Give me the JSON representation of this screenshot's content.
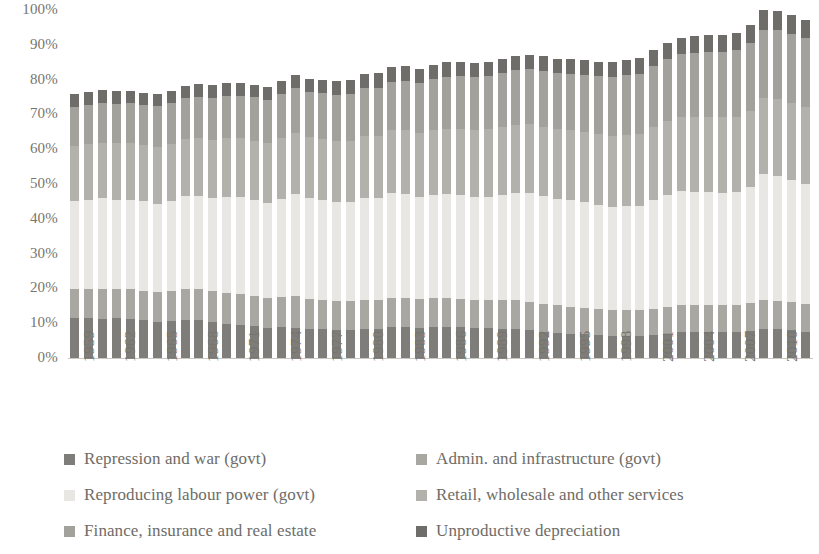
{
  "axes": {
    "y_ticks": [
      "100%",
      "90%",
      "80%",
      "70%",
      "60%",
      "50%",
      "40%",
      "30%",
      "20%",
      "10%",
      "0%"
    ],
    "y_min": 0,
    "y_max": 100,
    "x_tick_labels": [
      "1959",
      "1962",
      "1965",
      "1968",
      "1971",
      "1974",
      "1977",
      "1980",
      "1983",
      "1986",
      "1989",
      "1992",
      "1995",
      "1998",
      "2001",
      "2004",
      "2007",
      "2010"
    ]
  },
  "legend": {
    "items": [
      {
        "label": "Repression and war (govt)",
        "color": "#7f7d79"
      },
      {
        "label": "Admin. and infrastructure (govt)",
        "color": "#a9a7a2"
      },
      {
        "label": "Reproducing labour power (govt)",
        "color": "#e8e7e3"
      },
      {
        "label": "Retail, wholesale and other services",
        "color": "#b3b1ac"
      },
      {
        "label": "Finance, insurance and real estate",
        "color": "#a3a19c"
      },
      {
        "label": "Unproductive depreciation",
        "color": "#6f6d69"
      }
    ]
  },
  "chart_data": {
    "type": "bar",
    "stacked": true,
    "title": "",
    "xlabel": "",
    "ylabel": "",
    "ylim": [
      0,
      100
    ],
    "grid": false,
    "legend_position": "bottom",
    "categories": [
      "1959",
      "1960",
      "1961",
      "1962",
      "1963",
      "1964",
      "1965",
      "1966",
      "1967",
      "1968",
      "1969",
      "1970",
      "1971",
      "1972",
      "1973",
      "1974",
      "1975",
      "1976",
      "1977",
      "1978",
      "1979",
      "1980",
      "1981",
      "1982",
      "1983",
      "1984",
      "1985",
      "1986",
      "1987",
      "1988",
      "1989",
      "1990",
      "1991",
      "1992",
      "1993",
      "1994",
      "1995",
      "1996",
      "1997",
      "1998",
      "1999",
      "2000",
      "2001",
      "2002",
      "2003",
      "2004",
      "2005",
      "2006",
      "2007",
      "2008",
      "2009",
      "2010",
      "2011",
      "2012"
    ],
    "series": [
      {
        "name": "Repression and war (govt)",
        "color": "#7f7d79",
        "values": [
          11.5,
          11.4,
          11.3,
          11.4,
          11.2,
          10.8,
          10.4,
          10.6,
          11.0,
          10.9,
          10.4,
          9.9,
          9.5,
          9.2,
          8.7,
          8.8,
          8.7,
          8.4,
          8.3,
          8.1,
          8.1,
          8.3,
          8.4,
          8.8,
          8.9,
          8.7,
          9.0,
          9.0,
          8.9,
          8.6,
          8.5,
          8.4,
          8.3,
          8.0,
          7.6,
          7.2,
          7.0,
          6.8,
          6.6,
          6.4,
          6.4,
          6.4,
          6.6,
          7.0,
          7.4,
          7.5,
          7.5,
          7.5,
          7.5,
          7.8,
          8.3,
          8.2,
          8.0,
          7.6
        ]
      },
      {
        "name": "Admin. and infrastructure (govt)",
        "color": "#a9a7a2",
        "values": [
          8.3,
          8.4,
          8.6,
          8.5,
          8.5,
          8.5,
          8.6,
          8.7,
          8.9,
          8.9,
          8.8,
          8.9,
          8.9,
          8.7,
          8.5,
          8.7,
          9.0,
          8.7,
          8.5,
          8.3,
          8.2,
          8.4,
          8.3,
          8.5,
          8.4,
          8.2,
          8.3,
          8.3,
          8.2,
          8.1,
          8.1,
          8.2,
          8.3,
          8.2,
          8.0,
          7.9,
          7.8,
          7.6,
          7.5,
          7.4,
          7.4,
          7.4,
          7.6,
          7.8,
          7.9,
          7.8,
          7.8,
          7.7,
          7.7,
          7.9,
          8.4,
          8.3,
          8.1,
          7.9
        ]
      },
      {
        "name": "Reproducing labour power (govt)",
        "color": "#e8e7e3",
        "values": [
          25.2,
          25.5,
          26.0,
          25.6,
          25.8,
          25.7,
          25.4,
          25.9,
          26.6,
          26.8,
          26.8,
          27.5,
          27.8,
          27.6,
          27.4,
          28.3,
          29.5,
          29.0,
          28.6,
          28.3,
          28.4,
          29.3,
          29.3,
          30.1,
          29.9,
          29.4,
          29.6,
          29.8,
          29.8,
          29.6,
          29.8,
          30.2,
          30.9,
          31.2,
          31.0,
          30.6,
          30.5,
          30.3,
          29.9,
          29.7,
          29.8,
          29.9,
          31.1,
          32.1,
          32.6,
          32.5,
          32.5,
          32.3,
          32.4,
          33.5,
          36.1,
          35.8,
          35.0,
          34.4
        ]
      },
      {
        "name": "Retail, wholesale and other services",
        "color": "#b3b1ac",
        "values": [
          16.0,
          16.1,
          16.0,
          16.2,
          16.2,
          16.3,
          16.3,
          16.3,
          16.4,
          16.6,
          16.8,
          16.9,
          16.9,
          17.0,
          17.1,
          17.3,
          17.4,
          17.4,
          17.5,
          17.6,
          17.8,
          17.9,
          17.9,
          18.0,
          18.2,
          18.4,
          18.6,
          18.8,
          19.0,
          19.2,
          19.3,
          19.5,
          19.6,
          19.8,
          19.9,
          20.0,
          20.1,
          20.2,
          20.3,
          20.4,
          20.6,
          20.7,
          21.0,
          21.2,
          21.3,
          21.5,
          21.6,
          21.7,
          21.8,
          21.9,
          22.0,
          22.1,
          22.2,
          22.2
        ]
      },
      {
        "name": "Finance, insurance and real estate",
        "color": "#a3a19c",
        "values": [
          11.2,
          11.3,
          11.4,
          11.4,
          11.5,
          11.5,
          11.6,
          11.7,
          11.8,
          11.9,
          12.0,
          12.1,
          12.3,
          12.5,
          12.5,
          12.7,
          12.9,
          13.0,
          13.2,
          13.4,
          13.5,
          13.6,
          13.8,
          14.0,
          14.2,
          14.4,
          14.7,
          15.0,
          15.2,
          15.3,
          15.4,
          15.5,
          15.6,
          15.8,
          16.0,
          16.1,
          16.3,
          16.5,
          16.7,
          16.9,
          17.1,
          17.3,
          17.6,
          17.9,
          18.2,
          18.4,
          18.6,
          18.8,
          19.0,
          19.3,
          19.6,
          19.8,
          19.9,
          19.9
        ]
      },
      {
        "name": "Unproductive depreciation",
        "color": "#6f6d69",
        "values": [
          3.8,
          3.8,
          3.8,
          3.7,
          3.6,
          3.5,
          3.5,
          3.5,
          3.6,
          3.6,
          3.6,
          3.7,
          3.7,
          3.6,
          3.6,
          3.8,
          3.9,
          3.8,
          3.8,
          3.8,
          3.9,
          4.0,
          4.1,
          4.2,
          4.2,
          4.1,
          4.1,
          4.1,
          4.1,
          4.1,
          4.1,
          4.1,
          4.2,
          4.2,
          4.2,
          4.2,
          4.2,
          4.2,
          4.2,
          4.2,
          4.3,
          4.4,
          4.5,
          4.6,
          4.7,
          4.7,
          4.8,
          4.9,
          5.0,
          5.2,
          5.5,
          5.5,
          5.4,
          5.2
        ]
      }
    ]
  }
}
